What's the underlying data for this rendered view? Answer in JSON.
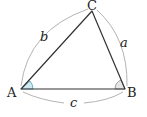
{
  "diagram": {
    "vertices": {
      "A": {
        "label": "A",
        "x": 21,
        "y": 89
      },
      "B": {
        "label": "B",
        "x": 125,
        "y": 89
      },
      "C": {
        "label": "C",
        "x": 92,
        "y": 11
      }
    },
    "sides": {
      "a": {
        "label": "a",
        "between": [
          "B",
          "C"
        ]
      },
      "b": {
        "label": "b",
        "between": [
          "A",
          "C"
        ]
      },
      "c": {
        "label": "c",
        "between": [
          "A",
          "B"
        ]
      }
    },
    "angles": {
      "A": {
        "fill": "#cfe9ee",
        "stroke": "#4aa3b5"
      },
      "B": {
        "fill": "#e6e6e6",
        "stroke": "#888888"
      }
    },
    "colors": {
      "triangle_stroke": "#333333",
      "arc_stroke": "#aaaaaa",
      "text": "#222222"
    }
  }
}
